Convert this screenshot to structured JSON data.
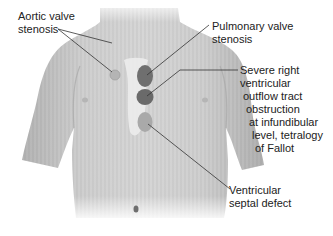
{
  "figure": {
    "colors": {
      "skin": "#c9c9c9",
      "skin_shadow": "#a9a9a9",
      "sternum": "#ececec",
      "pulmonary_area": "#6f6f6f",
      "rvot_area": "#6a6a6a",
      "vsd_area": "#a9a9a9",
      "aortic_area": "#b4b4b4",
      "leader_line": "#333333",
      "text": "#222222"
    }
  },
  "labels": {
    "aortic": {
      "lines": [
        "Aortic valve",
        "stenosis"
      ]
    },
    "pulmonary": {
      "lines": [
        "Pulmonary valve",
        "stenosis"
      ]
    },
    "rvot": {
      "lines": [
        "Severe right",
        "ventricular",
        "outflow tract",
        "obstruction",
        "at infundibular",
        "level, tetralogy",
        "of Fallot"
      ]
    },
    "vsd": {
      "lines": [
        "Ventricular",
        "septal defect"
      ]
    }
  }
}
